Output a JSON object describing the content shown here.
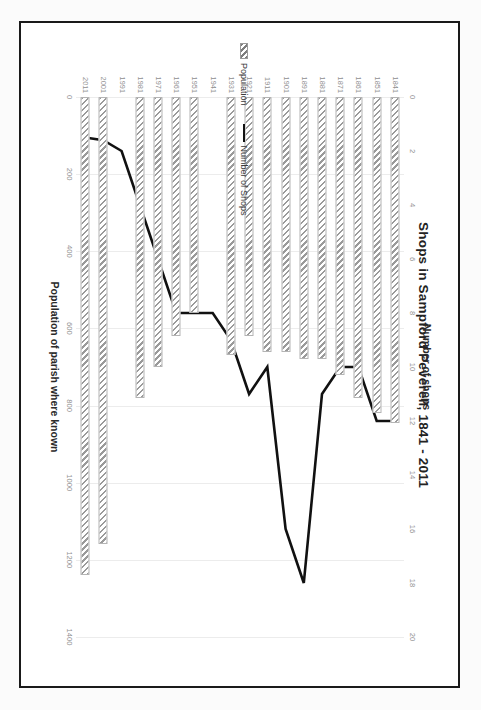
{
  "document": {
    "frame": true,
    "background_color": "#ffffff"
  },
  "rotation_note": "figure rendered rotated 90 degrees clockwise inside the page",
  "chart_data": {
    "type": "bar",
    "orientation": "horizontal",
    "title": "Shops in Sampford Peverell, 1841 - 2011",
    "categories": [
      "1841",
      "1851",
      "1861",
      "1871",
      "1881",
      "1891",
      "1901",
      "1911",
      "1921",
      "1931",
      "1941",
      "1951",
      "1961",
      "1971",
      "1981",
      "1991",
      "2001",
      "2011"
    ],
    "grid": true,
    "legend_position": "left-center",
    "legend": [
      "Population",
      "Number of Shops"
    ],
    "primary_axis": {
      "label": "Population of parish where known",
      "ticks": [
        "0",
        "200",
        "400",
        "600",
        "800",
        "1000",
        "1200",
        "1400"
      ],
      "tick_values": [
        0,
        200,
        400,
        600,
        800,
        1000,
        1200,
        1400
      ],
      "lim": [
        0,
        1400
      ],
      "position": "bottom"
    },
    "secondary_axis": {
      "label": "Number of shops",
      "ticks": [
        "0",
        "2",
        "4",
        "6",
        "8",
        "10",
        "12",
        "14",
        "16",
        "18",
        "20"
      ],
      "tick_values": [
        0,
        2,
        4,
        6,
        8,
        10,
        12,
        14,
        16,
        18,
        20
      ],
      "lim": [
        0,
        20
      ],
      "position": "top"
    },
    "series": [
      {
        "name": "Population",
        "axis": "primary",
        "render": "bar-hatched",
        "values": [
          846,
          820,
          780,
          720,
          680,
          680,
          660,
          660,
          620,
          670,
          null,
          560,
          620,
          700,
          780,
          null,
          1160,
          1240
        ]
      },
      {
        "name": "Number of Shops",
        "axis": "secondary",
        "render": "line",
        "values": [
          12,
          12,
          10,
          10,
          11,
          18,
          16,
          10,
          11,
          9,
          8,
          8,
          8,
          6,
          4,
          2,
          1.6,
          1.5
        ]
      }
    ]
  }
}
